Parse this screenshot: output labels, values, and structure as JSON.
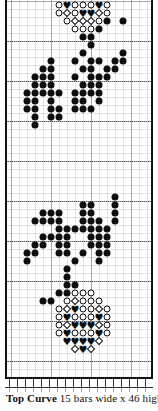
{
  "caption": {
    "title": "Top Curve",
    "text": " 15 bars wide x 46 high"
  },
  "chart_data": {
    "type": "heatmap",
    "title": "Top Curve",
    "subtitle": "15 bars wide x 46 high",
    "xlabel": "",
    "ylabel": "",
    "grid": true,
    "legend": "none",
    "columns": 17,
    "rows": 47,
    "cell_px": 8,
    "symbol_legend": {
      "filled-circle": "●",
      "open-circle": "○",
      "open-diamond": "◇",
      "filled-diamond": "◆",
      "filled-heart": "♥"
    },
    "points": [
      {
        "c": 6,
        "r": 0,
        "s": "open-circle"
      },
      {
        "c": 7,
        "r": 0,
        "s": "filled-heart"
      },
      {
        "c": 8,
        "r": 0,
        "s": "open-circle"
      },
      {
        "c": 9,
        "r": 0,
        "s": "open-circle"
      },
      {
        "c": 10,
        "r": 0,
        "s": "open-circle"
      },
      {
        "c": 11,
        "r": 0,
        "s": "filled-heart"
      },
      {
        "c": 12,
        "r": 0,
        "s": "open-circle"
      },
      {
        "c": 6,
        "r": 1,
        "s": "open-circle"
      },
      {
        "c": 7,
        "r": 1,
        "s": "open-diamond"
      },
      {
        "c": 8,
        "r": 1,
        "s": "open-circle"
      },
      {
        "c": 9,
        "r": 1,
        "s": "filled-heart"
      },
      {
        "c": 10,
        "r": 1,
        "s": "filled-heart"
      },
      {
        "c": 11,
        "r": 1,
        "s": "open-diamond"
      },
      {
        "c": 12,
        "r": 1,
        "s": "open-circle"
      },
      {
        "c": 7,
        "r": 2,
        "s": "open-circle"
      },
      {
        "c": 8,
        "r": 2,
        "s": "open-diamond"
      },
      {
        "c": 9,
        "r": 2,
        "s": "open-diamond"
      },
      {
        "c": 10,
        "r": 2,
        "s": "open-diamond"
      },
      {
        "c": 11,
        "r": 2,
        "s": "open-circle"
      },
      {
        "c": 12,
        "r": 2,
        "s": "filled-circle"
      },
      {
        "c": 14,
        "r": 2,
        "s": "filled-circle"
      },
      {
        "c": 8,
        "r": 3,
        "s": "open-circle"
      },
      {
        "c": 9,
        "r": 3,
        "s": "open-circle"
      },
      {
        "c": 10,
        "r": 3,
        "s": "open-circle"
      },
      {
        "c": 11,
        "r": 3,
        "s": "filled-circle"
      },
      {
        "c": 9,
        "r": 4,
        "s": "filled-circle"
      },
      {
        "c": 10,
        "r": 4,
        "s": "filled-circle"
      },
      {
        "c": 10,
        "r": 5,
        "s": "filled-circle"
      },
      {
        "c": 9,
        "r": 6,
        "s": "filled-circle"
      },
      {
        "c": 14,
        "r": 6,
        "s": "filled-circle"
      },
      {
        "c": 5,
        "r": 7,
        "s": "filled-circle"
      },
      {
        "c": 8,
        "r": 7,
        "s": "filled-circle"
      },
      {
        "c": 10,
        "r": 7,
        "s": "filled-circle"
      },
      {
        "c": 11,
        "r": 7,
        "s": "filled-circle"
      },
      {
        "c": 13,
        "r": 7,
        "s": "filled-circle"
      },
      {
        "c": 14,
        "r": 7,
        "s": "filled-circle"
      },
      {
        "c": 4,
        "r": 8,
        "s": "filled-circle"
      },
      {
        "c": 5,
        "r": 8,
        "s": "filled-circle"
      },
      {
        "c": 9,
        "r": 8,
        "s": "filled-circle"
      },
      {
        "c": 10,
        "r": 8,
        "s": "filled-circle"
      },
      {
        "c": 12,
        "r": 8,
        "s": "filled-circle"
      },
      {
        "c": 13,
        "r": 8,
        "s": "filled-circle"
      },
      {
        "c": 3,
        "r": 9,
        "s": "filled-circle"
      },
      {
        "c": 4,
        "r": 9,
        "s": "filled-circle"
      },
      {
        "c": 5,
        "r": 9,
        "s": "filled-circle"
      },
      {
        "c": 8,
        "r": 9,
        "s": "filled-circle"
      },
      {
        "c": 10,
        "r": 9,
        "s": "filled-circle"
      },
      {
        "c": 11,
        "r": 9,
        "s": "filled-circle"
      },
      {
        "c": 12,
        "r": 9,
        "s": "filled-circle"
      },
      {
        "c": 3,
        "r": 10,
        "s": "filled-circle"
      },
      {
        "c": 4,
        "r": 10,
        "s": "filled-circle"
      },
      {
        "c": 5,
        "r": 10,
        "s": "filled-circle"
      },
      {
        "c": 9,
        "r": 10,
        "s": "filled-circle"
      },
      {
        "c": 10,
        "r": 10,
        "s": "filled-circle"
      },
      {
        "c": 11,
        "r": 10,
        "s": "filled-circle"
      },
      {
        "c": 2,
        "r": 11,
        "s": "filled-circle"
      },
      {
        "c": 3,
        "r": 11,
        "s": "filled-circle"
      },
      {
        "c": 4,
        "r": 11,
        "s": "filled-circle"
      },
      {
        "c": 5,
        "r": 11,
        "s": "filled-circle"
      },
      {
        "c": 6,
        "r": 11,
        "s": "filled-circle"
      },
      {
        "c": 8,
        "r": 11,
        "s": "filled-circle"
      },
      {
        "c": 9,
        "r": 11,
        "s": "filled-circle"
      },
      {
        "c": 10,
        "r": 11,
        "s": "filled-circle"
      },
      {
        "c": 11,
        "r": 11,
        "s": "filled-circle"
      },
      {
        "c": 2,
        "r": 12,
        "s": "filled-circle"
      },
      {
        "c": 3,
        "r": 12,
        "s": "filled-circle"
      },
      {
        "c": 5,
        "r": 12,
        "s": "filled-circle"
      },
      {
        "c": 8,
        "r": 12,
        "s": "filled-circle"
      },
      {
        "c": 9,
        "r": 12,
        "s": "filled-circle"
      },
      {
        "c": 11,
        "r": 12,
        "s": "filled-circle"
      },
      {
        "c": 2,
        "r": 13,
        "s": "filled-circle"
      },
      {
        "c": 3,
        "r": 13,
        "s": "filled-circle"
      },
      {
        "c": 5,
        "r": 13,
        "s": "filled-circle"
      },
      {
        "c": 6,
        "r": 13,
        "s": "filled-circle"
      },
      {
        "c": 8,
        "r": 13,
        "s": "filled-circle"
      },
      {
        "c": 9,
        "r": 13,
        "s": "filled-circle"
      },
      {
        "c": 10,
        "r": 13,
        "s": "filled-circle"
      },
      {
        "c": 3,
        "r": 14,
        "s": "filled-circle"
      },
      {
        "c": 5,
        "r": 14,
        "s": "filled-circle"
      },
      {
        "c": 6,
        "r": 14,
        "s": "filled-circle"
      },
      {
        "c": 3,
        "r": 15,
        "s": "filled-circle"
      },
      {
        "c": 13,
        "r": 24,
        "s": "filled-circle"
      },
      {
        "c": 9,
        "r": 25,
        "s": "filled-circle"
      },
      {
        "c": 10,
        "r": 25,
        "s": "filled-circle"
      },
      {
        "c": 13,
        "r": 25,
        "s": "filled-circle"
      },
      {
        "c": 4,
        "r": 26,
        "s": "filled-circle"
      },
      {
        "c": 5,
        "r": 26,
        "s": "filled-circle"
      },
      {
        "c": 6,
        "r": 26,
        "s": "filled-circle"
      },
      {
        "c": 9,
        "r": 26,
        "s": "filled-circle"
      },
      {
        "c": 10,
        "r": 26,
        "s": "filled-circle"
      },
      {
        "c": 13,
        "r": 26,
        "s": "filled-circle"
      },
      {
        "c": 3,
        "r": 27,
        "s": "filled-circle"
      },
      {
        "c": 4,
        "r": 27,
        "s": "filled-circle"
      },
      {
        "c": 5,
        "r": 27,
        "s": "filled-circle"
      },
      {
        "c": 6,
        "r": 27,
        "s": "filled-circle"
      },
      {
        "c": 9,
        "r": 27,
        "s": "filled-circle"
      },
      {
        "c": 10,
        "r": 27,
        "s": "filled-circle"
      },
      {
        "c": 11,
        "r": 27,
        "s": "filled-circle"
      },
      {
        "c": 13,
        "r": 27,
        "s": "filled-circle"
      },
      {
        "c": 6,
        "r": 28,
        "s": "filled-circle"
      },
      {
        "c": 7,
        "r": 28,
        "s": "filled-circle"
      },
      {
        "c": 8,
        "r": 28,
        "s": "filled-circle"
      },
      {
        "c": 9,
        "r": 28,
        "s": "filled-circle"
      },
      {
        "c": 10,
        "r": 28,
        "s": "filled-circle"
      },
      {
        "c": 11,
        "r": 28,
        "s": "filled-circle"
      },
      {
        "c": 12,
        "r": 28,
        "s": "filled-circle"
      },
      {
        "c": 4,
        "r": 29,
        "s": "filled-circle"
      },
      {
        "c": 5,
        "r": 29,
        "s": "filled-circle"
      },
      {
        "c": 6,
        "r": 29,
        "s": "filled-circle"
      },
      {
        "c": 7,
        "r": 29,
        "s": "filled-circle"
      },
      {
        "c": 10,
        "r": 29,
        "s": "filled-circle"
      },
      {
        "c": 11,
        "r": 29,
        "s": "filled-circle"
      },
      {
        "c": 12,
        "r": 29,
        "s": "filled-circle"
      },
      {
        "c": 3,
        "r": 30,
        "s": "filled-circle"
      },
      {
        "c": 4,
        "r": 30,
        "s": "filled-circle"
      },
      {
        "c": 6,
        "r": 30,
        "s": "filled-circle"
      },
      {
        "c": 7,
        "r": 30,
        "s": "filled-circle"
      },
      {
        "c": 10,
        "r": 30,
        "s": "filled-circle"
      },
      {
        "c": 11,
        "r": 30,
        "s": "filled-circle"
      },
      {
        "c": 12,
        "r": 30,
        "s": "filled-circle"
      },
      {
        "c": 2,
        "r": 31,
        "s": "filled-circle"
      },
      {
        "c": 3,
        "r": 31,
        "s": "filled-circle"
      },
      {
        "c": 6,
        "r": 31,
        "s": "filled-circle"
      },
      {
        "c": 7,
        "r": 31,
        "s": "filled-circle"
      },
      {
        "c": 9,
        "r": 31,
        "s": "filled-circle"
      },
      {
        "c": 11,
        "r": 31,
        "s": "filled-circle"
      },
      {
        "c": 12,
        "r": 31,
        "s": "filled-circle"
      },
      {
        "c": 2,
        "r": 32,
        "s": "filled-circle"
      },
      {
        "c": 8,
        "r": 32,
        "s": "filled-circle"
      },
      {
        "c": 11,
        "r": 32,
        "s": "filled-circle"
      },
      {
        "c": 7,
        "r": 33,
        "s": "filled-circle"
      },
      {
        "c": 7,
        "r": 34,
        "s": "filled-circle"
      },
      {
        "c": 7,
        "r": 35,
        "s": "filled-circle"
      },
      {
        "c": 8,
        "r": 35,
        "s": "filled-circle"
      },
      {
        "c": 6,
        "r": 36,
        "s": "filled-circle"
      },
      {
        "c": 7,
        "r": 36,
        "s": "filled-circle"
      },
      {
        "c": 8,
        "r": 36,
        "s": "open-circle"
      },
      {
        "c": 9,
        "r": 36,
        "s": "open-circle"
      },
      {
        "c": 10,
        "r": 36,
        "s": "open-circle"
      },
      {
        "c": 4,
        "r": 37,
        "s": "filled-circle"
      },
      {
        "c": 5,
        "r": 37,
        "s": "filled-circle"
      },
      {
        "c": 7,
        "r": 37,
        "s": "open-circle"
      },
      {
        "c": 8,
        "r": 37,
        "s": "open-diamond"
      },
      {
        "c": 9,
        "r": 37,
        "s": "open-circle"
      },
      {
        "c": 10,
        "r": 37,
        "s": "open-circle"
      },
      {
        "c": 11,
        "r": 37,
        "s": "open-circle"
      },
      {
        "c": 6,
        "r": 38,
        "s": "open-circle"
      },
      {
        "c": 7,
        "r": 38,
        "s": "open-diamond"
      },
      {
        "c": 8,
        "r": 38,
        "s": "filled-heart"
      },
      {
        "c": 9,
        "r": 38,
        "s": "open-circle"
      },
      {
        "c": 10,
        "r": 38,
        "s": "open-circle"
      },
      {
        "c": 11,
        "r": 38,
        "s": "open-diamond"
      },
      {
        "c": 12,
        "r": 38,
        "s": "open-circle"
      },
      {
        "c": 6,
        "r": 39,
        "s": "open-circle"
      },
      {
        "c": 7,
        "r": 39,
        "s": "filled-heart"
      },
      {
        "c": 8,
        "r": 39,
        "s": "open-circle"
      },
      {
        "c": 9,
        "r": 39,
        "s": "open-circle"
      },
      {
        "c": 10,
        "r": 39,
        "s": "open-circle"
      },
      {
        "c": 11,
        "r": 39,
        "s": "filled-heart"
      },
      {
        "c": 12,
        "r": 39,
        "s": "open-circle"
      },
      {
        "c": 6,
        "r": 40,
        "s": "open-circle"
      },
      {
        "c": 7,
        "r": 40,
        "s": "open-diamond"
      },
      {
        "c": 8,
        "r": 40,
        "s": "filled-heart"
      },
      {
        "c": 9,
        "r": 40,
        "s": "filled-heart"
      },
      {
        "c": 10,
        "r": 40,
        "s": "filled-heart"
      },
      {
        "c": 11,
        "r": 40,
        "s": "open-diamond"
      },
      {
        "c": 12,
        "r": 40,
        "s": "open-circle"
      },
      {
        "c": 6,
        "r": 41,
        "s": "open-circle"
      },
      {
        "c": 7,
        "r": 41,
        "s": "filled-heart"
      },
      {
        "c": 8,
        "r": 41,
        "s": "open-circle"
      },
      {
        "c": 9,
        "r": 41,
        "s": "open-circle"
      },
      {
        "c": 10,
        "r": 41,
        "s": "open-circle"
      },
      {
        "c": 11,
        "r": 41,
        "s": "filled-heart"
      },
      {
        "c": 12,
        "r": 41,
        "s": "open-circle"
      },
      {
        "c": 7,
        "r": 42,
        "s": "filled-heart"
      },
      {
        "c": 8,
        "r": 42,
        "s": "filled-heart"
      },
      {
        "c": 9,
        "r": 42,
        "s": "filled-heart"
      },
      {
        "c": 10,
        "r": 42,
        "s": "filled-heart"
      },
      {
        "c": 11,
        "r": 42,
        "s": "open-diamond"
      },
      {
        "c": 8,
        "r": 43,
        "s": "open-diamond"
      },
      {
        "c": 9,
        "r": 43,
        "s": "filled-heart"
      },
      {
        "c": 10,
        "r": 43,
        "s": "open-diamond"
      }
    ],
    "dotted_rule_rows": [
      4,
      9,
      14,
      19,
      24,
      29,
      34,
      39,
      44
    ]
  }
}
